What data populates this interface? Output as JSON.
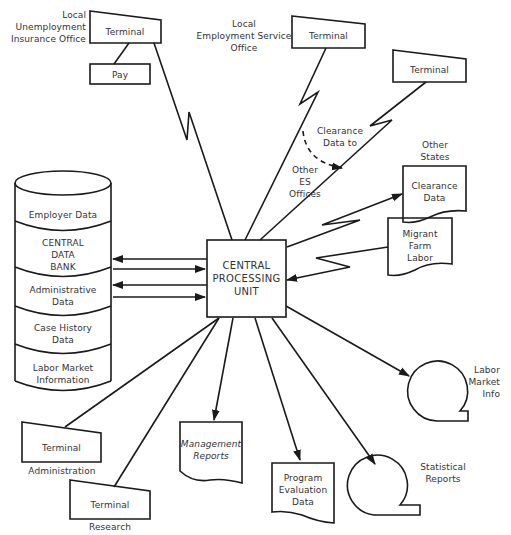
{
  "cpu": {
    "label": "CENTRAL\nPROCESSING\nUNIT"
  },
  "data_bank": {
    "segments": [
      {
        "label": "Employer Data"
      },
      {
        "label": "CENTRAL\nDATA\nBANK"
      },
      {
        "label": "Administrative\nData"
      },
      {
        "label": "Case History\nData"
      },
      {
        "label": "Labor Market\nInformation"
      }
    ]
  },
  "terminals": {
    "unemployment": {
      "caption": "Local\nUnemployment\nInsurance Office",
      "label": "Terminal"
    },
    "pay": {
      "label": "Pay"
    },
    "employment_service": {
      "caption": "Local\nEmployment Service\nOffice",
      "label": "Terminal"
    },
    "other_es": {
      "label": "Terminal"
    },
    "administration": {
      "label": "Terminal",
      "caption": "Administration"
    },
    "research": {
      "label": "Terminal",
      "caption": "Research"
    }
  },
  "annotations": {
    "clearance_data_to": "Clearance\nData to",
    "other_es_offices": "Other\nES\nOffices",
    "other_states": "Other\nStates"
  },
  "documents": {
    "clearance_data": "Clearance\nData",
    "migrant_farm_labor": "Migrant\nFarm\nLabor",
    "management_reports": "Management\nReports",
    "program_evaluation": "Program\nEvaluation\nData"
  },
  "tapes": {
    "labor_market_info": "Labor\nMarket\nInfo",
    "statistical_reports": "Statistical\nReports"
  },
  "colors": {
    "stroke": "#1a1a1a",
    "text": "#333333",
    "background": "#ffffff"
  }
}
